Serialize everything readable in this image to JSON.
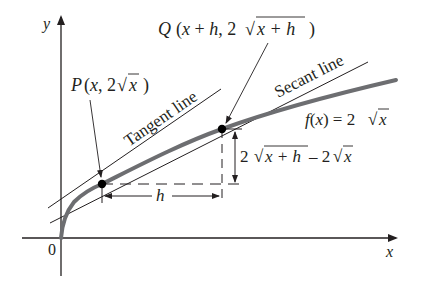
{
  "figure": {
    "type": "secant-tangent-diagram",
    "function_label": "f(x) = 2√x",
    "axes": {
      "x_label": "x",
      "y_label": "y",
      "origin_label": "0"
    },
    "points": {
      "P": {
        "label": "P(x, 2√x)",
        "name": "P",
        "coords_text": "(x, 2",
        "radicand": "x",
        "close": ")"
      },
      "Q": {
        "label": "Q (x + h, 2√(x + h))",
        "name": "Q",
        "coords_text": "(x + h, 2",
        "radicand": "x + h",
        "close": ")"
      }
    },
    "lines": {
      "tangent": "Tangent line",
      "secant": "Secant line"
    },
    "dimensions": {
      "horizontal": "h",
      "vertical": "2√(x+h) − 2√x",
      "vertical_parts": {
        "coef1": "2",
        "radicand1": "x + h",
        "minus": "– 2",
        "radicand2": "x"
      }
    },
    "function_parts": {
      "lhs": "f(x) = 2",
      "radicand": "x"
    },
    "colors": {
      "curve": "#6d6e71",
      "ink": "#231f20",
      "background": "#ffffff"
    }
  }
}
